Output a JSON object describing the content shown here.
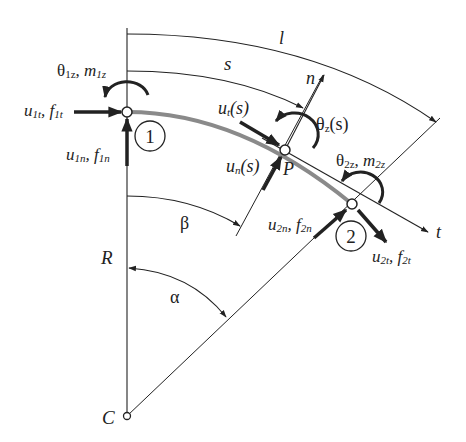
{
  "diagram": {
    "labels": {
      "l": "l",
      "s": "s",
      "n": "n",
      "t": "t",
      "P": "P",
      "R": "R",
      "C": "C",
      "alpha": "α",
      "beta": "β",
      "theta1z_m1z": "θ1z, m1z",
      "theta1z_sym": "θ",
      "theta1z_sub": "1z",
      "m1z_sym": "m",
      "m1z_sub": "1z",
      "u1t_sym": "u",
      "u1t_sub": "1t",
      "f1t_sym": "f",
      "f1t_sub": "1t",
      "u1n_sym": "u",
      "u1n_sub": "1n",
      "f1n_sym": "f",
      "f1n_sub": "1n",
      "ut_s_sym": "u",
      "ut_s_sub": "t",
      "ut_s_arg": "(s)",
      "un_s_sym": "u",
      "un_s_sub": "n",
      "un_s_arg": "(s)",
      "thetaz_s_sym": "θ",
      "thetaz_s_sub": "z",
      "thetaz_s_arg": "(s)",
      "theta2z_sym": "θ",
      "theta2z_sub": "2z",
      "m2z_sym": "m",
      "m2z_sub": "2z",
      "u2n_sym": "u",
      "u2n_sub": "2n",
      "f2n_sym": "f",
      "f2n_sub": "2n",
      "u2t_sym": "u",
      "u2t_sub": "2t",
      "f2t_sym": "f",
      "f2t_sub": "2t",
      "comma": ", "
    },
    "nodes": [
      {
        "id": "1",
        "label": "1"
      },
      {
        "id": "2",
        "label": "2"
      }
    ],
    "colors": {
      "line": "#222222",
      "beam": "#8a8a8a",
      "background": "#ffffff"
    }
  }
}
